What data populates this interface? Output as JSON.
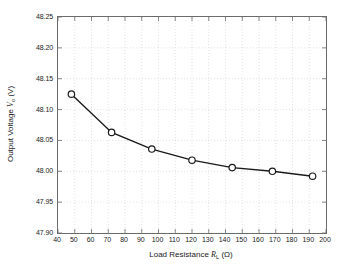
{
  "chart_data": {
    "type": "line",
    "title": "",
    "xlabel": "Load Resistance R_L (Ω)",
    "ylabel": "Output Voltage V_o (V)",
    "xlabel_parts": {
      "prefix": "Load Resistance ",
      "symbol": "R",
      "subscript": "L",
      "unit": " (Ω)"
    },
    "ylabel_parts": {
      "prefix": "Output Voltage ",
      "symbol": "V",
      "subscript": "o",
      "unit": " (V)"
    },
    "x": [
      48,
      72,
      96,
      120,
      144,
      168,
      192
    ],
    "values": [
      48.125,
      48.063,
      48.036,
      48.018,
      48.006,
      48.0,
      47.992
    ],
    "xlim": [
      40,
      200
    ],
    "ylim": [
      47.9,
      48.25
    ],
    "xticks": [
      40,
      50,
      60,
      70,
      80,
      90,
      100,
      110,
      120,
      130,
      140,
      150,
      160,
      170,
      180,
      190,
      200
    ],
    "yticks": [
      47.9,
      47.95,
      48.0,
      48.05,
      48.1,
      48.15,
      48.2,
      48.25
    ],
    "xtick_labels": [
      "40",
      "50",
      "60",
      "70",
      "80",
      "90",
      "100",
      "110",
      "120",
      "130",
      "140",
      "150",
      "160",
      "170",
      "180",
      "190",
      "200"
    ],
    "ytick_labels": [
      "47.90",
      "47.95",
      "48.00",
      "48.05",
      "48.10",
      "48.15",
      "48.20",
      "48.25"
    ],
    "grid": true,
    "legend": null,
    "marker": "circle-open",
    "line_color": "#1a1a1a",
    "marker_edge_color": "#1a1a1a",
    "marker_face_color": "#ffffff",
    "grid_color": "#cfcfcf",
    "axis_color": "#6b6b6b",
    "background": "#ffffff"
  }
}
